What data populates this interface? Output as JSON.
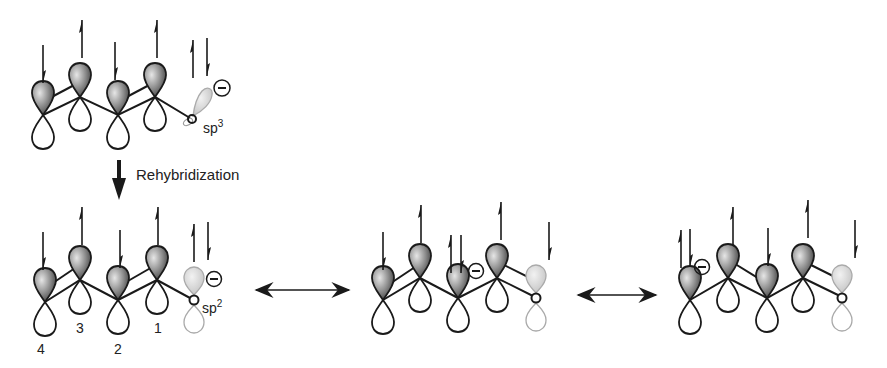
{
  "diagram": {
    "type": "orbital-resonance",
    "colors": {
      "line": "#1a1a1a",
      "lobe_shaded_dark": "#3a3a3a",
      "lobe_shaded_light": "#dcdcdc",
      "terminal_lobe": "#bdbdbd",
      "background": "#ffffff"
    },
    "top_structure": {
      "hybridization_label": "sp",
      "hybridization_superscript": "3",
      "charge": "−"
    },
    "rehybridization": {
      "label": "Rehybridization"
    },
    "bottom_structures": [
      {
        "hybridization_label": "sp",
        "hybridization_superscript": "2",
        "charge": "−",
        "atom_numbers": [
          "4",
          "3",
          "2",
          "1"
        ]
      },
      {
        "charge": "−"
      },
      {
        "charge": "−"
      }
    ],
    "resonance_arrows": [
      "↔",
      "↔"
    ]
  }
}
